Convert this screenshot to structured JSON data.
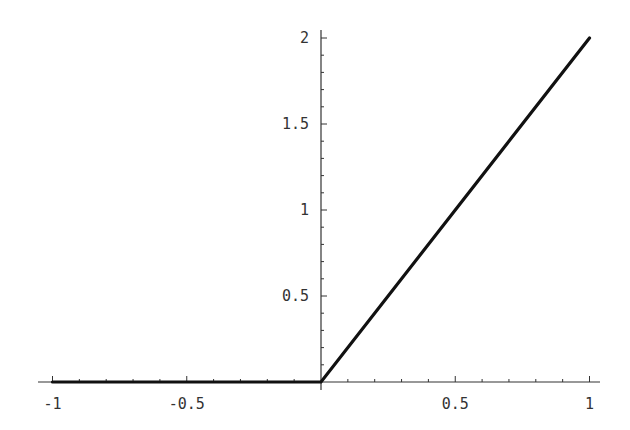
{
  "chart_data": {
    "type": "line",
    "title": "",
    "xlabel": "",
    "ylabel": "",
    "xlim": [
      -1,
      1
    ],
    "ylim": [
      0,
      2
    ],
    "grid": false,
    "legend": null,
    "series": [
      {
        "name": "f(x) = max(0, 2x)",
        "x": [
          -1,
          0,
          1
        ],
        "y": [
          0,
          0,
          2
        ]
      }
    ],
    "x_ticks": {
      "major": [
        -1,
        -0.5,
        0.5,
        1
      ],
      "labels": [
        "-1",
        "-0.5",
        "0.5",
        "1"
      ],
      "minor_step": 0.1
    },
    "y_ticks": {
      "major": [
        0.5,
        1,
        1.5,
        2
      ],
      "labels": [
        "0.5",
        "1",
        "1.5",
        "2"
      ],
      "minor_step": 0.1
    },
    "axes_origin": [
      0,
      0
    ],
    "colors": {
      "line": "#111111",
      "axis": "#333333",
      "background": "#ffffff"
    }
  }
}
